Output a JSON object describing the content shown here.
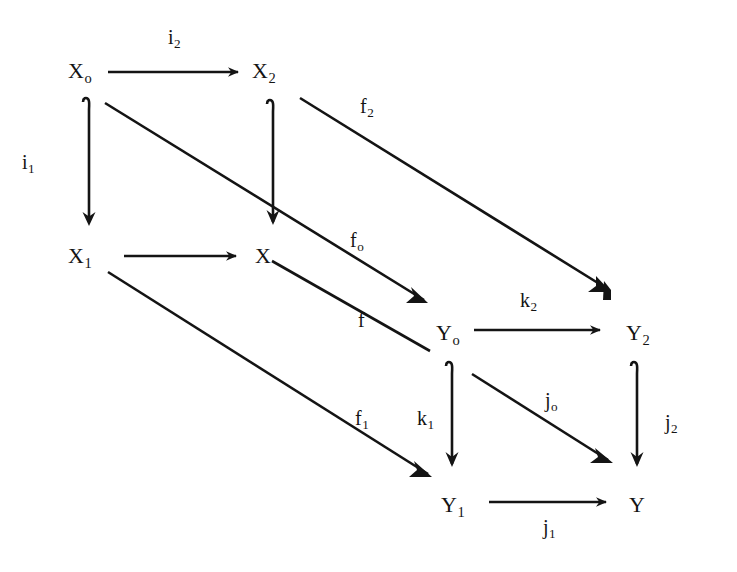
{
  "figure": {
    "kind": "commutative-diagram",
    "background_color": "#ffffff",
    "ink_color": "#141414",
    "width": 737,
    "height": 572
  },
  "objects": [
    {
      "id": "X0",
      "base": "X",
      "sub": "o",
      "x": 68,
      "y": 60
    },
    {
      "id": "X2",
      "base": "X",
      "sub": "2",
      "x": 252,
      "y": 60
    },
    {
      "id": "X1",
      "base": "X",
      "sub": "1",
      "x": 68,
      "y": 245
    },
    {
      "id": "X",
      "base": "X",
      "sub": "",
      "x": 255,
      "y": 245
    },
    {
      "id": "Y0",
      "base": "Y",
      "sub": "o",
      "x": 436,
      "y": 322
    },
    {
      "id": "Y2",
      "base": "Y",
      "sub": "2",
      "x": 626,
      "y": 322
    },
    {
      "id": "Y1",
      "base": "Y",
      "sub": "1",
      "x": 441,
      "y": 494
    },
    {
      "id": "Y",
      "base": "Y",
      "sub": "",
      "x": 629,
      "y": 494
    }
  ],
  "morphisms": [
    {
      "id": "i2",
      "base": "i",
      "sub": "2",
      "from": "X0",
      "to": "X2",
      "label_x": 168,
      "label_y": 27,
      "style": "horizontal"
    },
    {
      "id": "i1",
      "base": "i",
      "sub": "1",
      "from": "X0",
      "to": "X1",
      "label_x": 22,
      "label_y": 152,
      "style": "vertical-hooked"
    },
    {
      "id": "unlabeled_X1_X",
      "base": "",
      "sub": "",
      "from": "X1",
      "to": "X",
      "label_x": 0,
      "label_y": 0,
      "style": "horizontal"
    },
    {
      "id": "f0",
      "base": "f",
      "sub": "o",
      "from": "X0",
      "to": "Y0",
      "label_x": 350,
      "label_y": 230,
      "style": "diagonal"
    },
    {
      "id": "f",
      "base": "f",
      "sub": "",
      "from": "X",
      "to": "Y0-offset",
      "label_x": 358,
      "label_y": 310,
      "style": "diagonal-plain"
    },
    {
      "id": "f2",
      "base": "f",
      "sub": "2",
      "from": "X2",
      "to": "Y2",
      "label_x": 360,
      "label_y": 96,
      "style": "diagonal-barbed"
    },
    {
      "id": "f1",
      "base": "f",
      "sub": "1",
      "from": "X1",
      "to": "Y1",
      "label_x": 355,
      "label_y": 408,
      "style": "diagonal"
    },
    {
      "id": "k2",
      "base": "k",
      "sub": "2",
      "from": "Y0",
      "to": "Y2",
      "label_x": 520,
      "label_y": 290,
      "style": "horizontal"
    },
    {
      "id": "k1",
      "base": "k",
      "sub": "1",
      "from": "Y0",
      "to": "Y1",
      "label_x": 417,
      "label_y": 408,
      "style": "vertical-hooked"
    },
    {
      "id": "j0",
      "base": "j",
      "sub": "o",
      "from": "Y0",
      "to": "Y",
      "label_x": 545,
      "label_y": 390,
      "style": "diagonal"
    },
    {
      "id": "j2",
      "base": "j",
      "sub": "2",
      "from": "Y2",
      "to": "Y",
      "label_x": 665,
      "label_y": 412,
      "style": "vertical-hooked"
    },
    {
      "id": "j1",
      "base": "j",
      "sub": "1",
      "from": "Y1",
      "to": "Y",
      "label_x": 543,
      "label_y": 517,
      "style": "horizontal"
    }
  ]
}
